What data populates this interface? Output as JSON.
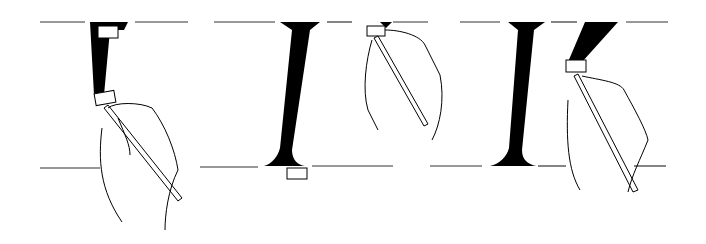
{
  "figure": {
    "panels": [
      {
        "id": 1,
        "step": "downstroke of stem in progress"
      },
      {
        "id": 2,
        "step": "completed I stem, brush lifted to start next stroke"
      },
      {
        "id": 3,
        "step": "I complete, diagonal stroke of K in progress"
      }
    ],
    "colors": {
      "ink": "#000000",
      "line": "#333333",
      "background": "#ffffff"
    }
  }
}
